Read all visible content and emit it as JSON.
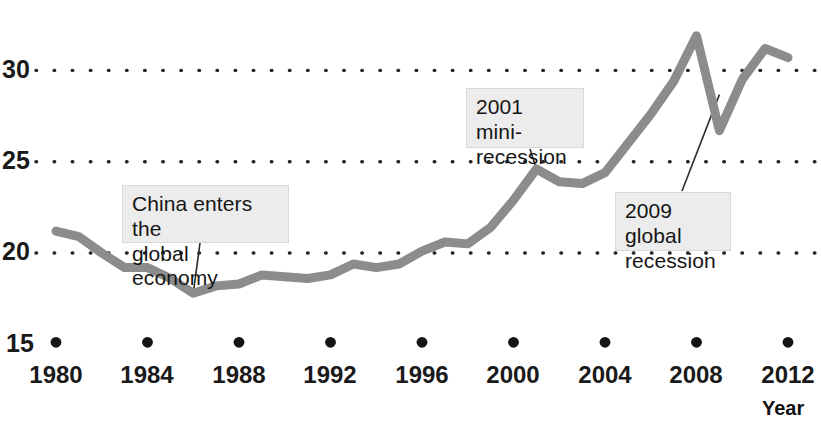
{
  "chart_data": {
    "type": "line",
    "title": "",
    "xlabel": "Year",
    "ylabel": "",
    "xlim": [
      1980,
      2012
    ],
    "ylim": [
      15,
      33
    ],
    "grid": "dotted-horizontal",
    "legend": "none",
    "line_color": "#8c8c8c",
    "x": [
      1980,
      1981,
      1982,
      1983,
      1984,
      1985,
      1986,
      1987,
      1988,
      1989,
      1990,
      1991,
      1992,
      1993,
      1994,
      1995,
      1996,
      1997,
      1998,
      1999,
      2000,
      2001,
      2002,
      2003,
      2004,
      2005,
      2006,
      2007,
      2008,
      2009,
      2010,
      2011,
      2012
    ],
    "values": [
      21.2,
      20.9,
      20.0,
      19.2,
      19.2,
      18.6,
      17.8,
      18.2,
      18.3,
      18.8,
      18.7,
      18.6,
      18.8,
      19.4,
      19.2,
      19.4,
      20.1,
      20.6,
      20.5,
      21.4,
      22.9,
      24.6,
      23.9,
      23.8,
      24.4,
      26.0,
      27.6,
      29.4,
      31.9,
      26.7,
      29.5,
      31.2,
      30.7
    ],
    "xticks": [
      {
        "value": 1980,
        "label": "1980"
      },
      {
        "value": 1984,
        "label": "1984"
      },
      {
        "value": 1988,
        "label": "1988"
      },
      {
        "value": 1992,
        "label": "1992"
      },
      {
        "value": 1996,
        "label": "1996"
      },
      {
        "value": 2000,
        "label": "2000"
      },
      {
        "value": 2004,
        "label": "2004"
      },
      {
        "value": 2008,
        "label": "2008"
      },
      {
        "value": 2012,
        "label": "2012"
      }
    ],
    "yticks": [
      {
        "value": 30,
        "label": "30",
        "gridline": true
      },
      {
        "value": 25,
        "label": "25",
        "gridline": true
      },
      {
        "value": 20,
        "label": "20",
        "gridline": true
      },
      {
        "value": 15,
        "label": "15",
        "gridline": false
      }
    ],
    "annotations": [
      {
        "id": "china-entry",
        "text": "China enters the\nglobal economy",
        "target_x": 1986,
        "target_y": 17.8
      },
      {
        "id": "mini-recession-2001",
        "text": "2001 mini-\nrecession",
        "target_x": 2001,
        "target_y": 24.6
      },
      {
        "id": "global-recession-2009",
        "text": "2009 global\nrecession",
        "target_x": 2009,
        "target_y": 26.7
      }
    ]
  },
  "axis": {
    "x_title": "Year"
  }
}
